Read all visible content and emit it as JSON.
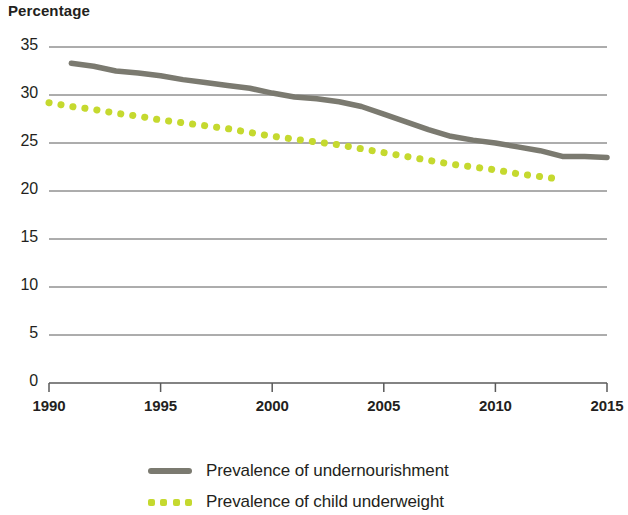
{
  "chart_data": {
    "type": "line",
    "title": "",
    "ylabel": "Percentage",
    "xlabel": "",
    "ylim": [
      0,
      35
    ],
    "xlim": [
      1990,
      2015
    ],
    "grid": true,
    "legend_position": "bottom",
    "y_ticks": [
      35,
      30,
      25,
      20,
      15,
      10,
      5,
      0
    ],
    "x_ticks": [
      1990,
      1995,
      2000,
      2005,
      2010,
      2015
    ],
    "series": [
      {
        "name": "Prevalence of undernourishment",
        "color": "#7b7a70",
        "style": "solid",
        "x": [
          1991,
          1992,
          1993,
          1994,
          1995,
          1996,
          1997,
          1998,
          1999,
          2000,
          2001,
          2002,
          2003,
          2004,
          2005,
          2006,
          2007,
          2008,
          2009,
          2010,
          2011,
          2012,
          2013,
          2014,
          2015
        ],
        "values": [
          33.3,
          33.0,
          32.5,
          32.3,
          32.0,
          31.6,
          31.3,
          31.0,
          30.7,
          30.2,
          29.8,
          29.6,
          29.3,
          28.8,
          28.0,
          27.2,
          26.4,
          25.7,
          25.3,
          25.0,
          24.6,
          24.2,
          23.6,
          23.6,
          23.5
        ]
      },
      {
        "name": "Prevalence of child underweight",
        "color": "#c5d92f",
        "style": "dotted",
        "x": [
          1990,
          1991,
          1992,
          1993,
          1994,
          1995,
          1996,
          1997,
          1998,
          1999,
          2000,
          2001,
          2002,
          2003,
          2004,
          2005,
          2006,
          2007,
          2008,
          2009,
          2010,
          2011,
          2012,
          2013
        ],
        "values": [
          29.2,
          28.8,
          28.5,
          28.1,
          27.8,
          27.4,
          27.1,
          26.8,
          26.5,
          26.1,
          25.7,
          25.4,
          25.1,
          24.8,
          24.4,
          24.0,
          23.6,
          23.2,
          22.8,
          22.5,
          22.2,
          21.8,
          21.5,
          21.2
        ]
      }
    ]
  },
  "axis": {
    "y_title": "Percentage",
    "y_tick_labels": [
      "35",
      "30",
      "25",
      "20",
      "15",
      "10",
      "5",
      "0"
    ],
    "x_tick_labels": [
      "1990",
      "1995",
      "2000",
      "2005",
      "2010",
      "2015"
    ]
  },
  "legend": {
    "items": [
      {
        "label": "Prevalence of undernourishment",
        "color": "#7b7a70",
        "style": "solid"
      },
      {
        "label": "Prevalence of child underweight",
        "color": "#c5d92f",
        "style": "dotted"
      }
    ]
  },
  "colors": {
    "undernourishment": "#7b7a70",
    "child_underweight": "#c5d92f",
    "gridline": "#5a5a5a",
    "text": "#231f20"
  }
}
